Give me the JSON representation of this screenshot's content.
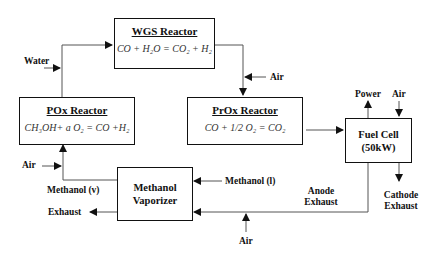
{
  "diagram": {
    "nodes": [
      {
        "id": "wgs",
        "title": "WGS Reactor",
        "equation": "CO + H₂O = CO₂ + H₂"
      },
      {
        "id": "pox",
        "title": "POx Reactor",
        "equation": "CH₃OH+ a O₂ = CO +H₂"
      },
      {
        "id": "prox",
        "title": "PrOx Reactor",
        "equation": "CO + 1/2 O₂ = CO₂"
      },
      {
        "id": "fuelcell",
        "line1": "Fuel Cell",
        "line2": "(50kW)"
      },
      {
        "id": "vaporizer",
        "line1": "Methanol",
        "line2": "Vaporizer"
      }
    ],
    "labels": {
      "water": "Water",
      "air_wgs_prox": "Air",
      "power": "Power",
      "air_fuelcell": "Air",
      "air_pox": "Air",
      "methanol_v": "Methanol (v)",
      "methanol_l": "Methanol (l)",
      "exhaust": "Exhaust",
      "anode_exhaust_1": "Anode",
      "anode_exhaust_2": "Exhaust",
      "cathode_exhaust_1": "Cathode",
      "cathode_exhaust_2": "Exhaust",
      "air_bottom": "Air"
    },
    "edges": [
      {
        "from": "pox",
        "to": "wgs"
      },
      {
        "from": "Water",
        "to": "pox-wgs line"
      },
      {
        "from": "wgs",
        "to": "prox"
      },
      {
        "from": "Air",
        "to": "wgs-prox line"
      },
      {
        "from": "prox",
        "to": "fuelcell"
      },
      {
        "from": "fuelcell",
        "to": "Power"
      },
      {
        "from": "Air",
        "to": "fuelcell"
      },
      {
        "from": "fuelcell",
        "to": "Cathode Exhaust"
      },
      {
        "from": "fuelcell",
        "to": "vaporizer",
        "label": "Anode Exhaust"
      },
      {
        "from": "Air",
        "to": "anode exhaust line"
      },
      {
        "from": "Methanol (l)",
        "to": "vaporizer"
      },
      {
        "from": "vaporizer",
        "to": "pox",
        "label": "Methanol (v)"
      },
      {
        "from": "Air",
        "to": "vaporizer-pox line"
      },
      {
        "from": "vaporizer",
        "to": "Exhaust"
      }
    ]
  }
}
